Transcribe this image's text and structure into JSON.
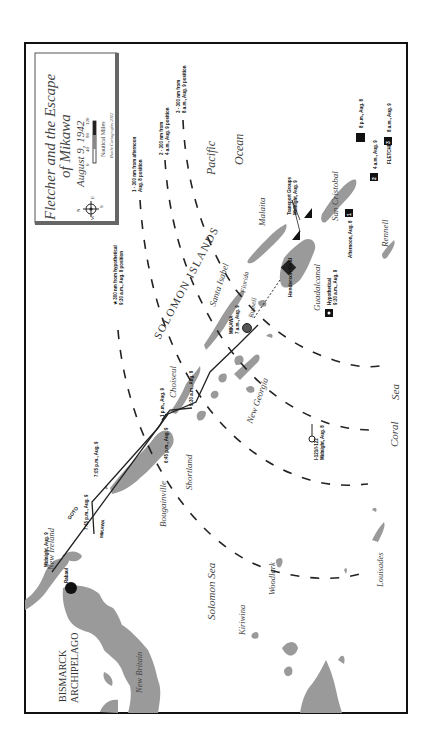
{
  "title_box": {
    "title_line1": "Fletcher and the Escape",
    "title_line2": "of Mikawa",
    "date": "August 9, 1942",
    "scale_label": "Nautical Miles",
    "scale_ticks": [
      "0",
      "40",
      "80",
      "120"
    ],
    "credit": "Battle Cartography 2012",
    "compass": {
      "n": "N",
      "s": "S",
      "e": "E",
      "w": "W"
    }
  },
  "regions": {
    "bismarck": [
      "BISMARCK",
      "ARCHIPELAGO"
    ],
    "solomon_islands": "SOLOMON ISLANDS",
    "pacific": "Pacific",
    "ocean": "Ocean",
    "coral": "Coral",
    "sea": "Sea",
    "solomon_sea": "Solomon Sea"
  },
  "islands": {
    "new_britain": "New Britain",
    "new_ireland": "New Ireland",
    "bougainville": "Bougainville",
    "shortland": "Shortland",
    "choiseul": "Choiseul",
    "santa_isabel": "Santa Isabel",
    "new_georgia": "New Georgia",
    "russell": "Russell",
    "florida": "Florida",
    "guadalcanal": "Guadalcanal",
    "malaita": "Malaita",
    "san_cristobal": "San Cristobal",
    "rennell": "Rennell",
    "woodlark": "Woodlark",
    "kiriwina": "Kiriwina",
    "louisades": "Louisades"
  },
  "places": {
    "rabaul": "Rabaul",
    "henderson_field": "Henderson Field"
  },
  "range_arcs": {
    "arc_star": [
      "★ 300 nm from hypothetical",
      "9:30 a.m., Aug. 9 position"
    ],
    "arc_1": [
      "1 - 300 nm from afternoon",
      "Aug. 8 position"
    ],
    "arc_2": [
      "2 - 300 nm from",
      "4 a.m., Aug. 9 position"
    ],
    "arc_3": [
      "3 - 300 nm from",
      "8 a.m., Aug. 9 position"
    ]
  },
  "tracks": {
    "goto_label": "GOTO",
    "mikawa_label": "MIKAWA",
    "goto_start": "Midnight, Aug. 9",
    "goto_705": "7:05 p.m., Aug. 9",
    "mikawa_745": "7:45 p.m., Aug. 9",
    "t_645": "6:45 p.m., Aug. 9",
    "t_1pm": "1 p.m., Aug. 9",
    "t_930": "9:30 a.m., Aug. 9",
    "mikawa_end": [
      "MIKAWA",
      "7 a.m., Aug. 9"
    ]
  },
  "markers": {
    "transport": [
      "Transport Groups",
      "Midnight, Aug. 9"
    ],
    "hypothetical": [
      "Hypothetical",
      "9:30 a.m., Aug. 9"
    ],
    "afternoon": "Afternoon, Aug. 8",
    "afternoon_num": "1",
    "p8pm": "8 p.m., Aug. 8",
    "p4am": "4 a.m., Aug. 9",
    "p4am_num": "2",
    "fletcher": "FLETCHER",
    "p8am_num": "3",
    "p8am": "8 a.m., Aug. 9",
    "sub": [
      "I-121/I-122",
      "Midnight, Aug. 8"
    ]
  }
}
